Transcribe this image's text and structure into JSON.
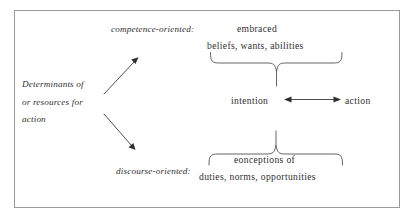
{
  "figure": {
    "frame": {
      "border_color": "#9a9a9a",
      "background": "#ffffff"
    },
    "left_group": {
      "lines": [
        "Determinants of",
        "or resources for",
        "action"
      ]
    },
    "top_branch": {
      "label": "competence-oriented:",
      "head_text": "embraced",
      "list_text": "beliefs, wants, abilities"
    },
    "bottom_branch": {
      "label": "discourse-oriented:",
      "head_text": "eonceptions of",
      "list_text": "duties, norms, opportunities"
    },
    "center_row": {
      "left_term": "intention",
      "right_term": "action"
    },
    "connectors": {
      "upper_arrow": "diagonal-arrow-up-right",
      "lower_arrow": "diagonal-arrow-down-right",
      "center_arrow": "double-headed-horizontal-arrow",
      "top_brace": "downward-curly-brace",
      "bottom_brace": "upward-curly-brace"
    }
  }
}
